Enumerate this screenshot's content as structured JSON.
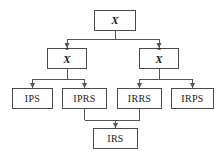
{
  "diagram": {
    "type": "tree",
    "canvas": {
      "width": 222,
      "height": 161
    },
    "style": {
      "background_color": "#ffffff",
      "box_fill": "#ffffff",
      "box_border_color": "#4a4a4a",
      "connector_color": "#555555",
      "text_color": "#1a1a1a"
    },
    "nodes": [
      {
        "id": "X",
        "label": "X",
        "base_glyph": "X",
        "accent": "none",
        "accent_glyph": "",
        "kind": "math",
        "level": 0,
        "x": 94,
        "y": 10,
        "w": 42,
        "h": 21
      },
      {
        "id": "Xhat",
        "label": "X̂",
        "base_glyph": "X",
        "accent": "hat",
        "accent_glyph": "ˆ",
        "kind": "math",
        "level": 1,
        "x": 47,
        "y": 48,
        "w": 40,
        "h": 21
      },
      {
        "id": "Xtilde",
        "label": "X̃",
        "base_glyph": "X",
        "accent": "tilde",
        "accent_glyph": "˜",
        "kind": "math",
        "level": 1,
        "x": 139,
        "y": 48,
        "w": 40,
        "h": 21
      },
      {
        "id": "IPS",
        "label": "IPS",
        "base_glyph": "IPS",
        "accent": "none",
        "accent_glyph": "",
        "kind": "acronym",
        "level": 2,
        "x": 12,
        "y": 88,
        "w": 41,
        "h": 21
      },
      {
        "id": "IPRS",
        "label": "IPRS",
        "base_glyph": "IPRS",
        "accent": "none",
        "accent_glyph": "",
        "kind": "acronym",
        "level": 2,
        "x": 62,
        "y": 88,
        "w": 45,
        "h": 21
      },
      {
        "id": "IRRS",
        "label": "IRRS",
        "base_glyph": "IRRS",
        "accent": "none",
        "accent_glyph": "",
        "kind": "acronym",
        "level": 2,
        "x": 117,
        "y": 88,
        "w": 45,
        "h": 21
      },
      {
        "id": "IRPS",
        "label": "IRPS",
        "base_glyph": "IRPS",
        "accent": "none",
        "accent_glyph": "",
        "kind": "acronym",
        "level": 2,
        "x": 171,
        "y": 88,
        "w": 43,
        "h": 21
      },
      {
        "id": "IRS",
        "label": "IRS",
        "base_glyph": "IRS",
        "accent": "none",
        "accent_glyph": "",
        "kind": "acronym",
        "level": 3,
        "x": 93,
        "y": 128,
        "w": 45,
        "h": 21
      }
    ],
    "edges": [
      {
        "id": "e-X-Xhat",
        "from": "X",
        "to": "Xhat",
        "arrow": "down"
      },
      {
        "id": "e-X-Xtilde",
        "from": "X",
        "to": "Xtilde",
        "arrow": "down"
      },
      {
        "id": "e-Xhat-IPS",
        "from": "Xhat",
        "to": "IPS",
        "arrow": "down"
      },
      {
        "id": "e-Xhat-IPRS",
        "from": "Xhat",
        "to": "IPRS",
        "arrow": "down"
      },
      {
        "id": "e-Xtilde-IRRS",
        "from": "Xtilde",
        "to": "IRRS",
        "arrow": "down"
      },
      {
        "id": "e-Xtilde-IRPS",
        "from": "Xtilde",
        "to": "IRPS",
        "arrow": "down"
      },
      {
        "id": "e-IPRS-IRS",
        "from": "IPRS",
        "to": "IRS",
        "arrow": "down"
      },
      {
        "id": "e-IRRS-IRS",
        "from": "IRRS",
        "to": "IRS",
        "arrow": "down"
      }
    ]
  }
}
